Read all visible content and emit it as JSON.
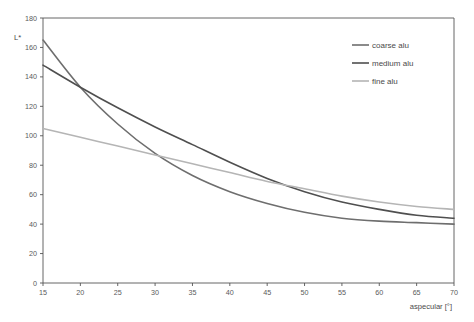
{
  "chart_data": {
    "type": "line",
    "title": "",
    "xlabel": "aspecular [°]",
    "ylabel": "L*",
    "xlim": [
      15,
      70
    ],
    "ylim": [
      0,
      180
    ],
    "xticks": [
      15,
      20,
      25,
      30,
      35,
      40,
      45,
      50,
      55,
      60,
      65,
      70
    ],
    "yticks": [
      0,
      20,
      40,
      60,
      80,
      100,
      120,
      140,
      160,
      180
    ],
    "grid": false,
    "legend_position": "upper-right",
    "x": [
      15,
      20,
      25,
      30,
      35,
      40,
      45,
      50,
      55,
      60,
      65,
      70
    ],
    "series": [
      {
        "name": "coarse alu",
        "color": "#6e6e6e",
        "width": 1.6,
        "values": [
          165,
          133,
          108,
          88,
          73,
          62,
          54,
          48,
          44,
          42,
          41,
          40
        ]
      },
      {
        "name": "medium alu",
        "color": "#4f4f4f",
        "width": 1.6,
        "values": [
          148,
          133,
          119,
          106,
          94,
          82,
          71,
          62,
          55,
          50,
          46,
          44
        ]
      },
      {
        "name": "fine alu",
        "color": "#b5b5b5",
        "width": 1.6,
        "values": [
          105,
          99,
          93,
          87,
          81,
          75,
          69,
          64,
          59,
          55,
          52,
          50
        ]
      }
    ]
  },
  "legend": {
    "items": [
      {
        "label": "coarse alu"
      },
      {
        "label": "medium alu"
      },
      {
        "label": "fine alu"
      }
    ]
  },
  "axes": {
    "y_title": "L*",
    "x_title": "aspecular [°]"
  }
}
